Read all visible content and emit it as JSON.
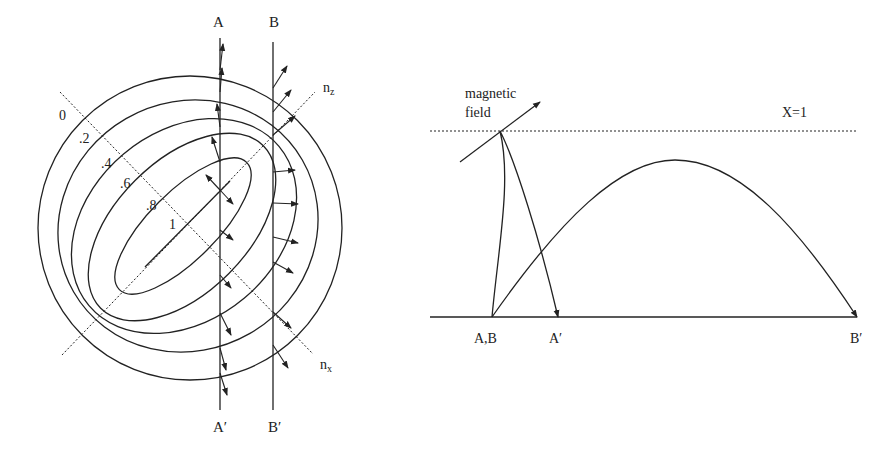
{
  "left_diagram": {
    "ray_labels": {
      "A": "A",
      "B": "B",
      "A_prime": "A′",
      "B_prime": "B′"
    },
    "axis_labels": {
      "nz": "n",
      "nz_sub": "z",
      "nx": "n",
      "nx_sub": "x"
    },
    "contour_labels": [
      "0",
      ".2",
      ".4",
      ".6",
      ".8",
      "1"
    ]
  },
  "right_diagram": {
    "magnetic_field_line1": "magnetic",
    "magnetic_field_line2": "field",
    "cutoff_label": "X=1",
    "start_label": "A,B",
    "end_A_label": "A′",
    "end_B_label": "B′"
  },
  "colors": {
    "stroke": "#222222",
    "background": "#ffffff"
  }
}
